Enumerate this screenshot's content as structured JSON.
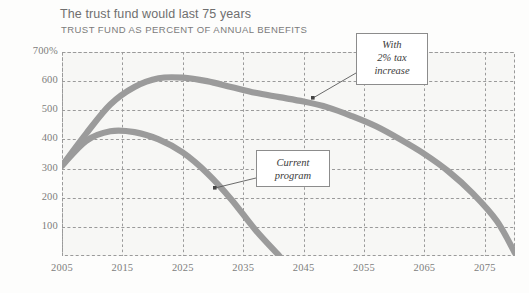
{
  "header": {
    "title": "The trust fund would last 75 years",
    "subtitle": "TRUST FUND AS PERCENT OF ANNUAL BENEFITS"
  },
  "annotations": {
    "tax": {
      "line1": "With",
      "line2": "2% tax",
      "line3": "increase"
    },
    "current": {
      "line1": "Current",
      "line2": "program"
    }
  },
  "colors": {
    "line": "#9b9b9b",
    "plot_background": "#f7f7f5",
    "grid": "#9a9a9a",
    "title_text": "#6f6f6f",
    "tick_text": "#7d7d7d",
    "callout_border": "#8c8c8c"
  },
  "chart_data": {
    "type": "line",
    "title": "The trust fund would last 75 years",
    "subtitle": "TRUST FUND AS PERCENT OF ANNUAL BENEFITS",
    "xlabel": "",
    "ylabel": "",
    "xlim": [
      2005,
      2080
    ],
    "ylim": [
      0,
      700
    ],
    "grid": true,
    "legend_position": "annotated-callouts",
    "x_ticks": [
      "2005",
      "2015",
      "2025",
      "2035",
      "2045",
      "2055",
      "2065",
      "2075"
    ],
    "x_tick_values": [
      2005,
      2015,
      2025,
      2035,
      2045,
      2055,
      2065,
      2075
    ],
    "y_ticks": [
      "100",
      "200",
      "300",
      "400",
      "500",
      "600",
      "700%"
    ],
    "y_tick_values": [
      100,
      200,
      300,
      400,
      500,
      600,
      700
    ],
    "series": [
      {
        "name": "With 2% tax increase",
        "x": [
          2005,
          2009,
          2013,
          2017,
          2021,
          2025,
          2029,
          2033,
          2037,
          2041,
          2045,
          2049,
          2053,
          2057,
          2061,
          2065,
          2069,
          2073,
          2077,
          2080
        ],
        "values": [
          310,
          420,
          520,
          580,
          610,
          612,
          600,
          580,
          560,
          545,
          530,
          510,
          480,
          445,
          400,
          350,
          290,
          215,
          120,
          10
        ]
      },
      {
        "name": "Current program",
        "x": [
          2005,
          2009,
          2013,
          2017,
          2021,
          2025,
          2029,
          2033,
          2037,
          2041
        ],
        "values": [
          310,
          395,
          428,
          425,
          400,
          355,
          285,
          195,
          90,
          0
        ]
      }
    ]
  }
}
